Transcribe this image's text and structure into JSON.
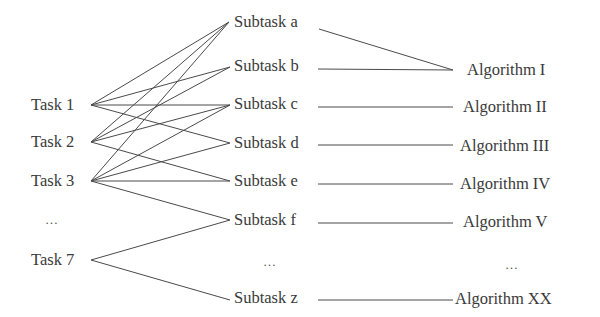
{
  "diagram": {
    "type": "task-subtask-algorithm mapping",
    "tasks": [
      {
        "id": "task1",
        "label": "Task 1",
        "y": 105
      },
      {
        "id": "task2",
        "label": "Task 2",
        "y": 142
      },
      {
        "id": "task3",
        "label": "Task 3",
        "y": 181
      },
      {
        "id": "task-ellipsis",
        "label": "…",
        "y": 220
      },
      {
        "id": "task7",
        "label": "Task 7",
        "y": 260
      }
    ],
    "subtasks": [
      {
        "id": "a",
        "label": "Subtask a",
        "y": 22
      },
      {
        "id": "b",
        "label": "Subtask b",
        "y": 66
      },
      {
        "id": "c",
        "label": "Subtask c",
        "y": 104
      },
      {
        "id": "d",
        "label": "Subtask d",
        "y": 143
      },
      {
        "id": "e",
        "label": "Subtask e",
        "y": 181
      },
      {
        "id": "f",
        "label": "Subtask f",
        "y": 220
      },
      {
        "id": "sub-ellipsis",
        "label": "…",
        "y": 262
      },
      {
        "id": "z",
        "label": "Subtask z",
        "y": 298
      }
    ],
    "algorithms": [
      {
        "id": "alg1",
        "label": "Algorithm I",
        "x": 467,
        "y": 70
      },
      {
        "id": "alg2",
        "label": "Algorithm II",
        "x": 463,
        "y": 107
      },
      {
        "id": "alg3",
        "label": "Algorithm III",
        "x": 460,
        "y": 146
      },
      {
        "id": "alg4",
        "label": "Algorithm IV",
        "x": 460,
        "y": 184
      },
      {
        "id": "alg5",
        "label": "Algorithm V",
        "x": 463,
        "y": 222
      },
      {
        "id": "alg-ellipsis",
        "label": "…",
        "x": 505,
        "y": 265
      },
      {
        "id": "alg20",
        "label": "Algorithm XX",
        "x": 455,
        "y": 299
      }
    ],
    "task_subtask_edges": [
      [
        "Task 1",
        "Subtask a"
      ],
      [
        "Task 1",
        "Subtask b"
      ],
      [
        "Task 1",
        "Subtask c"
      ],
      [
        "Task 1",
        "Subtask d"
      ],
      [
        "Task 2",
        "Subtask a"
      ],
      [
        "Task 2",
        "Subtask b"
      ],
      [
        "Task 2",
        "Subtask c"
      ],
      [
        "Task 2",
        "Subtask e"
      ],
      [
        "Task 3",
        "Subtask a"
      ],
      [
        "Task 3",
        "Subtask c"
      ],
      [
        "Task 3",
        "Subtask d"
      ],
      [
        "Task 3",
        "Subtask e"
      ],
      [
        "Task 3",
        "Subtask f"
      ],
      [
        "Task 7",
        "Subtask f"
      ],
      [
        "Task 7",
        "Subtask z"
      ]
    ],
    "subtask_algorithm_edges": [
      [
        "Subtask a",
        "Algorithm I"
      ],
      [
        "Subtask b",
        "Algorithm I"
      ],
      [
        "Subtask c",
        "Algorithm II"
      ],
      [
        "Subtask d",
        "Algorithm III"
      ],
      [
        "Subtask e",
        "Algorithm IV"
      ],
      [
        "Subtask f",
        "Algorithm V"
      ],
      [
        "Subtask z",
        "Algorithm XX"
      ]
    ]
  }
}
